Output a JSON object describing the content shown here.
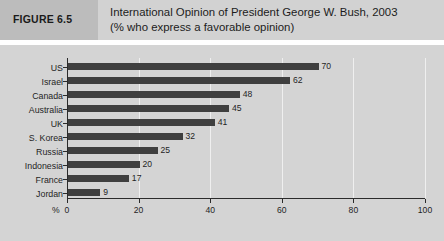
{
  "figure": {
    "tag": "FIGURE 6.5",
    "title_line1": "International Opinion of President George W. Bush, 2003",
    "title_line2": "(% who express a favorable opinion)"
  },
  "axis": {
    "percent_symbol": "%",
    "tick_labels": [
      "0",
      "20",
      "40",
      "60",
      "80",
      "100"
    ]
  },
  "colors": {
    "header_band": "#d2d2d2",
    "figure_tag_box": "#bcbcbc",
    "chart_background": "#d4d4d4",
    "bar": "#3f3f3f",
    "axis_line": "#2b2b2b",
    "gridline": "#efefef",
    "text": "#1f1f1f"
  },
  "chart_data": {
    "type": "bar",
    "orientation": "horizontal",
    "title": "International Opinion of President George W. Bush, 2003",
    "subtitle": "(% who express a favorable opinion)",
    "xlabel": "%",
    "ylabel": "",
    "xlim": [
      0,
      100
    ],
    "xticks": [
      0,
      20,
      40,
      60,
      80,
      100
    ],
    "grid": true,
    "legend": false,
    "data_labels": true,
    "categories": [
      "US",
      "Israel",
      "Canada",
      "Australia",
      "UK",
      "S. Korea",
      "Russia",
      "Indonesia",
      "France",
      "Jordan"
    ],
    "values": [
      70,
      62,
      48,
      45,
      41,
      32,
      25,
      20,
      17,
      9
    ]
  }
}
